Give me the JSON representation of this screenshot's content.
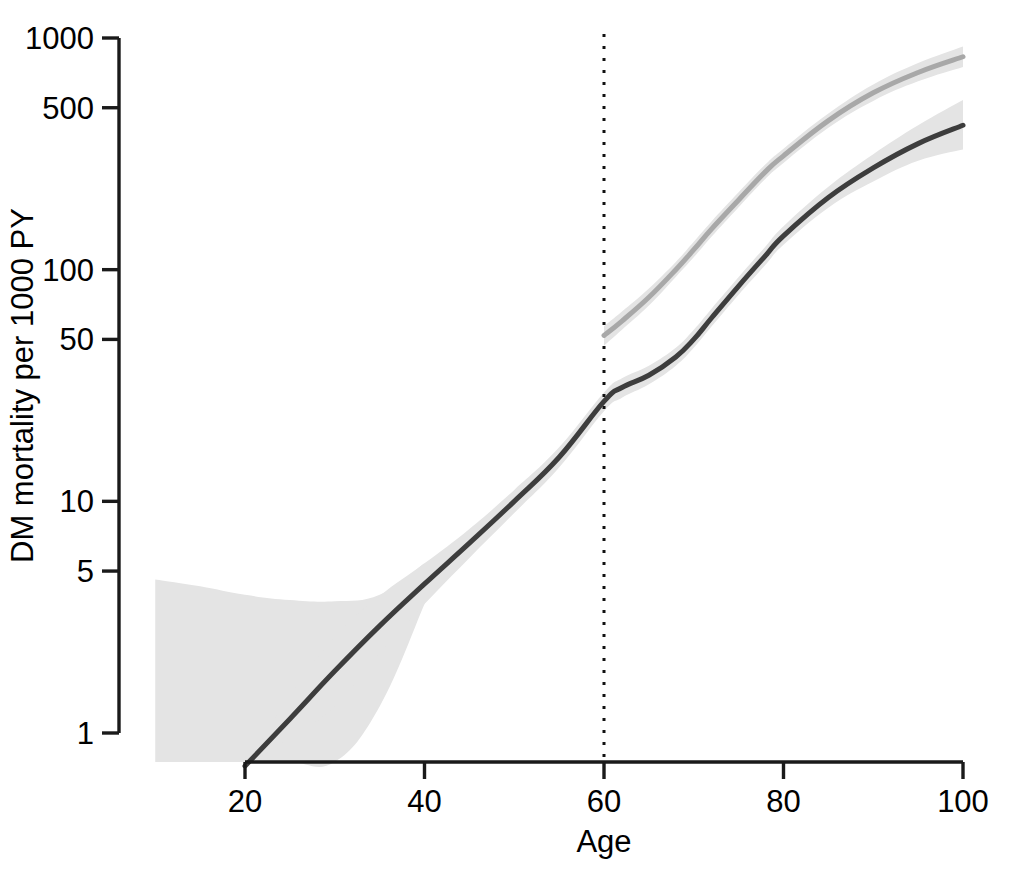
{
  "chart_data": {
    "type": "line",
    "title": "",
    "subtitle": "",
    "xlabel": "Age",
    "ylabel": "DM mortality per 1000 PY",
    "xlim": [
      10,
      100
    ],
    "ylim": [
      1,
      1000
    ],
    "yscale": "log",
    "xscale": "linear",
    "grid": false,
    "legend": "none",
    "xticks": [
      20,
      40,
      60,
      80,
      100
    ],
    "xtick_labels": [
      "20",
      "40",
      "60",
      "80",
      "100"
    ],
    "yticks": [
      1,
      5,
      10,
      50,
      100,
      500,
      1000
    ],
    "ytick_labels": [
      "1",
      "5",
      "10",
      "50",
      "100",
      "500",
      "1000"
    ],
    "annotations": [
      {
        "name": "age-60-reference-line",
        "type": "vertical-dotted-line",
        "x": 60,
        "label": ""
      }
    ],
    "series": [
      {
        "name": "dark-curve",
        "color": "#3d3d3d",
        "linewidth": 5,
        "band_color": "#e4e4e4",
        "x": [
          20,
          25,
          30,
          35,
          40,
          45,
          50,
          55,
          60,
          62,
          65,
          68,
          70,
          72,
          75,
          78,
          80,
          85,
          90,
          95,
          100
        ],
        "y": [
          0.72,
          1.15,
          1.85,
          2.9,
          4.4,
          6.6,
          10.0,
          15.5,
          27.0,
          31.0,
          35.0,
          42.0,
          50.0,
          62.0,
          85.0,
          115.0,
          140.0,
          205.0,
          275.0,
          350.0,
          420.0
        ],
        "band_low": [
          0.72,
          0.95,
          1.3,
          2.2,
          3.6,
          5.7,
          8.9,
          14.0,
          24.5,
          28.0,
          32.0,
          38.5,
          46.0,
          57.0,
          78.0,
          105.0,
          128.0,
          185.0,
          240.0,
          295.0,
          330.0
        ],
        "band_high": [
          0.72,
          1.45,
          2.6,
          3.9,
          5.4,
          7.6,
          11.2,
          17.1,
          29.5,
          34.0,
          38.5,
          46.0,
          55.0,
          68.0,
          93.0,
          126.0,
          154.0,
          228.0,
          315.0,
          420.0,
          540.0
        ]
      },
      {
        "name": "light-curve",
        "color": "#a8a8a8",
        "linewidth": 5,
        "band_color": "#ededed",
        "x": [
          60,
          62,
          65,
          68,
          70,
          72,
          75,
          78,
          80,
          85,
          90,
          95,
          100
        ],
        "y": [
          52.0,
          60.0,
          76.0,
          100.0,
          122.0,
          150.0,
          200.0,
          265.0,
          310.0,
          440.0,
          580.0,
          710.0,
          830.0
        ],
        "band_low": [
          47.0,
          55.0,
          70.0,
          93.0,
          113.0,
          139.0,
          186.0,
          247.0,
          289.0,
          410.0,
          535.0,
          650.0,
          750.0
        ],
        "band_high": [
          57.0,
          66.0,
          83.0,
          108.0,
          132.0,
          162.0,
          216.0,
          285.0,
          333.0,
          472.0,
          630.0,
          780.0,
          920.0
        ]
      }
    ],
    "left_band_only": {
      "name": "wide-left-ci-band",
      "note": "wide confidence band below age 40 for dark curve",
      "x": [
        10,
        15,
        20,
        25,
        30,
        35,
        40
      ],
      "band_low": [
        0.62,
        0.62,
        0.62,
        0.62,
        0.62,
        1.3,
        3.6
      ],
      "band_high": [
        4.6,
        4.3,
        3.95,
        3.75,
        3.7,
        3.95,
        5.4
      ]
    }
  },
  "axes": {
    "x_title": "Age",
    "y_title": "DM mortality per 1000 PY"
  }
}
